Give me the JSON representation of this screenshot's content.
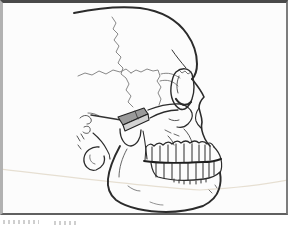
{
  "figure": {
    "alt": "Line drawing of a human skull in lateral view with a shaded rectangular implant block and pointer line placed at the zygomatic arch above the mandibular condyle",
    "page_background": "#ffffff",
    "frame": {
      "background": "#fcfcfc",
      "border_top": "#4a4a4a",
      "border_right": "#7d7d7d",
      "border_bottom": "#606060",
      "border_left": "#b2b2b2"
    },
    "ink_color": "#2b2b2b",
    "suture_color": "#7a7a7a",
    "crease_color": "#e6dfd2",
    "implant_top_fill": "#9a9a9a",
    "implant_front_fill": "#d4d4d4",
    "caption_fragment_color": "#a8a8a8"
  },
  "illustration": {
    "viewbox": "0 0 288 215",
    "strokes": [
      {
        "name": "crease-line",
        "d": "M0,169 C70,177 140,186 200,190 C235,188 268,184 288,180",
        "stroke": "#e6dfd2",
        "width": 1.2
      },
      {
        "name": "suture-vertical",
        "d": "M112,17 L116,23 L113,29 L118,34 L114,40 L119,46 L116,52 L121,57 L118,63 L123,68 L121,74 L126,78 L129,84 L126,90 L131,96 L128,102 L133,107",
        "stroke": "#7a7a7a",
        "width": 0.9
      },
      {
        "name": "suture-left-branch",
        "d": "M78,76 L85,73 L92,75 L99,71 L106,74 L113,70 L120,72 L126,69 L131,73",
        "stroke": "#7a7a7a",
        "width": 0.9
      },
      {
        "name": "suture-right-branch",
        "d": "M131,73 L136,70 L141,72 L147,69 L153,71 L158,70 L160,76 L157,81 L161,87 L158,93 L161,99 L159,105",
        "stroke": "#7a7a7a",
        "width": 0.9
      },
      {
        "name": "sphenoid-curve",
        "d": "M161,74 C168,72 174,74 180,78",
        "stroke": "#666666",
        "width": 0.8
      },
      {
        "name": "temporal-fossa-curve",
        "d": "M160,81 C167,79 173,81 178,86",
        "stroke": "#666666",
        "width": 0.8
      },
      {
        "name": "temporal-ridge",
        "d": "M172,50 C176,56 181,62 186,68",
        "stroke": "#333333",
        "width": 1
      },
      {
        "name": "cranium-outline",
        "d": "M74,13 C98,8 122,6 140,8 C162,11 178,21 187,34 C194,44 197,55 197,64 C197,71 195,76 192,79",
        "stroke": "#2b2b2b",
        "width": 2
      },
      {
        "name": "nasal-profile",
        "d": "M192,79 C196,84 201,90 204,97 C201,100 199,104 199,108 C200,113 202,117 202,122 C201,126 202,133 205,139 C206,141 208,144 210,146",
        "stroke": "#2b2b2b",
        "width": 1.6
      },
      {
        "name": "nasal-aperture",
        "d": "M199,108 C196,112 195,117 196,121 C197,124 199,126 201,128",
        "stroke": "#2b2b2b",
        "width": 1.1
      },
      {
        "name": "orbit-rim",
        "d": "M176,72 C182,67 189,68 192,74 C194,81 195,91 192,99 C190,106 185,111 180,109 C174,106 170,97 171,87 C172,79 173,75 176,72",
        "stroke": "#2b2b2b",
        "width": 1.4
      },
      {
        "name": "orbit-lower-band",
        "d": "M176,99 C180,105 186,107 191,102",
        "stroke": "#2b2b2b",
        "width": 2.2
      },
      {
        "name": "orbit-inner-line",
        "d": "M179,76 C177,81 176,87 178,93",
        "stroke": "#444444",
        "width": 0.9
      },
      {
        "name": "orbit-crack",
        "d": "M179,70 L182,73 L185,71 L188,74 L191,72",
        "stroke": "#555555",
        "width": 0.8
      },
      {
        "name": "zygomatic-arch-upper",
        "d": "M148,110 C158,106 170,103 181,104",
        "stroke": "#2b2b2b",
        "width": 1.3
      },
      {
        "name": "zygomatic-arch-lower",
        "d": "M150,118 C159,113 168,110 178,110",
        "stroke": "#2b2b2b",
        "width": 1.3
      },
      {
        "name": "zygoma-edge",
        "d": "M181,104 C187,106 191,109 192,113 C193,117 191,121 188,124 C185,127 181,128 177,127",
        "stroke": "#2b2b2b",
        "width": 1.2
      },
      {
        "name": "infraorbital-stroke",
        "d": "M169,119 C173,121 176,121 179,120",
        "stroke": "#444444",
        "width": 0.9
      },
      {
        "name": "maxilla-mark-1",
        "d": "M165,130 L171,133",
        "stroke": "#444444",
        "width": 0.8
      },
      {
        "name": "maxilla-mark-2",
        "d": "M174,134 L179,136",
        "stroke": "#444444",
        "width": 0.8
      },
      {
        "name": "maxilla-curve-1",
        "d": "M168,136 C171,139 173,142 174,145",
        "stroke": "#444444",
        "width": 0.9
      },
      {
        "name": "maxilla-curve-2",
        "d": "M184,129 C188,133 191,138 192,143",
        "stroke": "#444444",
        "width": 0.9
      },
      {
        "name": "teeth-upper-gumline",
        "d": "M146,147 Q150,142 154,146 Q159,141 163,145 Q168,140 172,144 Q177,139 181,143 Q186,139 190,143 Q195,139 199,143 Q203,140 207,144 Q211,141 214,147",
        "stroke": "#2b2b2b",
        "width": 1.2
      },
      {
        "name": "teeth-upper-back-edge",
        "d": "M146,147 L145,160",
        "stroke": "#2b2b2b",
        "width": 1
      },
      {
        "name": "teeth-upper-dividers",
        "d": "M152,147 L152,161 M160,146 L160,161 M168,145 L168,162 M176,144 L176,162 M184,144 L184,162 M192,144 L192,162 M199,145 L199,161 M205,145 L205,161 M210,146 L210,160",
        "stroke": "#2b2b2b",
        "width": 1
      },
      {
        "name": "incisor-front-edge",
        "d": "M214,147 C218,151 220,155 221,159",
        "stroke": "#2b2b2b",
        "width": 1.2
      },
      {
        "name": "teeth-occlusal-line",
        "d": "M144,161 C162,164 184,163 204,162 C210,162 216,161 221,159",
        "stroke": "#1e1e1e",
        "width": 1.9
      },
      {
        "name": "teeth-lower-dividers",
        "d": "M156,163 L156,177 M164,163 L164,178 M172,163 L172,179 M180,163 L180,180 M188,163 L188,180 M196,163 L196,179 M203,162 L203,178 M209,162 L209,177 M214,161 L214,175",
        "stroke": "#2b2b2b",
        "width": 1
      },
      {
        "name": "teeth-lower-gumline",
        "d": "M151,163 C152,170 154,175 158,177 C172,181 190,181 204,179 C211,178 217,175 220,172",
        "stroke": "#2b2b2b",
        "width": 1.3
      },
      {
        "name": "lower-front-edge",
        "d": "M221,159 C222,164 222,169 220,173",
        "stroke": "#2b2b2b",
        "width": 1.2
      },
      {
        "name": "teeth-root-ticks",
        "d": "M174,179 L174,182 M179,180 L179,183 M184,181 L184,184 M190,181 L190,184 M196,181 L196,184 M201,180 L201,183 M206,179 L206,182",
        "stroke": "#333333",
        "width": 1
      },
      {
        "name": "mandible-outline",
        "d": "M120,146 C114,157 109,169 108,179 C107,188 110,195 116,200 C127,208 147,212 166,212 C181,212 194,209 203,206 C211,202 217,196 219,189 C221,183 221,178 220,173",
        "stroke": "#2b2b2b",
        "width": 1.9
      },
      {
        "name": "ramus-anterior-edge",
        "d": "M143,131 C145,140 146,150 147,159",
        "stroke": "#2b2b2b",
        "width": 1.1
      },
      {
        "name": "ramus-inner-line",
        "d": "M127,149 C122,158 119,168 119,177",
        "stroke": "#555555",
        "width": 0.9
      },
      {
        "name": "jaw-inner-mark-1",
        "d": "M128,186 C132,189 136,191 140,191",
        "stroke": "#666666",
        "width": 0.8
      },
      {
        "name": "jaw-inner-mark-2",
        "d": "M150,202 C155,204 159,205 163,205",
        "stroke": "#777777",
        "width": 0.8
      },
      {
        "name": "chin-mark-1",
        "d": "M209,190 L212,193",
        "stroke": "#555555",
        "width": 0.8
      },
      {
        "name": "chin-mark-2",
        "d": "M215,185 L217,188",
        "stroke": "#555555",
        "width": 0.8
      },
      {
        "name": "condyle-dome",
        "d": "M120,129 C120,139 125,146 131,146 C137,145 141,138 141,130",
        "stroke": "#2b2b2b",
        "width": 1.3
      },
      {
        "name": "mastoid-edge",
        "d": "M93,133 C99,138 104,144 107,150 C109,153 110,156 110,159",
        "stroke": "#2b2b2b",
        "width": 1.1
      },
      {
        "name": "ear-curl-1",
        "d": "M80,118 C84,114 89,115 91,119 C92,122 90,124 87,124",
        "stroke": "#444444",
        "width": 0.9
      },
      {
        "name": "ear-curl-2",
        "d": "M84,127 C88,125 91,127 90,131 C89,134 85,134 83,132",
        "stroke": "#444444",
        "width": 0.9
      },
      {
        "name": "ear-tick-1",
        "d": "M77,136 L80,141",
        "stroke": "#444444",
        "width": 0.9
      },
      {
        "name": "ear-tick-2",
        "d": "M81,134 L84,139",
        "stroke": "#444444",
        "width": 0.9
      },
      {
        "name": "ear-tick-3",
        "d": "M78,145 L81,149",
        "stroke": "#444444",
        "width": 0.9
      },
      {
        "name": "ear-hair-stroke",
        "d": "M88,113 C92,113 96,114 99,116",
        "stroke": "#555555",
        "width": 0.8
      },
      {
        "name": "ear-hook",
        "d": "M99,147 C92,146 85,151 84,158 C83,165 89,172 96,170 C102,168 106,162 104,156",
        "stroke": "#2b2b2b",
        "width": 1.3
      },
      {
        "name": "ear-hook-inner",
        "d": "M90,155 C89,159 91,163 95,164",
        "stroke": "#555555",
        "width": 0.8
      },
      {
        "name": "implant-pointer",
        "d": "M91,115 L121,120",
        "stroke": "#333333",
        "width": 1.5
      },
      {
        "name": "implant-top-face",
        "d": "M118,117 L144,108 L148,114 L123,125 Z",
        "stroke": "#222222",
        "width": 1.1,
        "fill": "#9a9a9a"
      },
      {
        "name": "implant-front-face",
        "d": "M123,125 L148,114 L149,120 L125,131 Z",
        "stroke": "#222222",
        "width": 1.1,
        "fill": "#d4d4d4"
      },
      {
        "name": "implant-seam",
        "d": "M135,111 L138,119",
        "stroke": "#333333",
        "width": 0.8
      }
    ]
  }
}
